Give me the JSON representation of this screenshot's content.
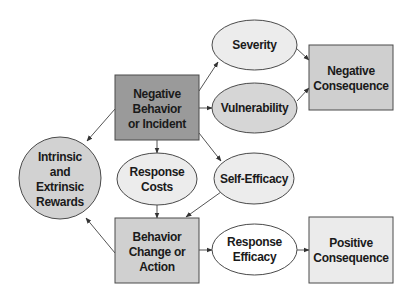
{
  "colors": {
    "dark_box": "#9a9a9a",
    "mid_box": "#cfcfcf",
    "light_box": "#ebebeb",
    "circle": "#d2d2d2",
    "ellipse_light": "#ececec",
    "ellipse_mid": "#d6d6d6",
    "ellipse_white": "#ffffff",
    "stroke": "#4a4a4a",
    "edge": "#555555"
  },
  "nodes": {
    "negative_behavior": {
      "shape": "rect",
      "lines": [
        "Negative",
        "Behavior",
        "or Incident"
      ]
    },
    "severity": {
      "shape": "ellipse",
      "lines": [
        "Severity"
      ]
    },
    "vulnerability": {
      "shape": "ellipse",
      "lines": [
        "Vulnerability"
      ]
    },
    "negative_consequence": {
      "shape": "rect",
      "lines": [
        "Negative",
        "Consequence"
      ]
    },
    "rewards": {
      "shape": "circle",
      "lines": [
        "Intrinsic",
        "and",
        "Extrinsic",
        "Rewards"
      ]
    },
    "response_costs": {
      "shape": "ellipse",
      "lines": [
        "Response",
        "Costs"
      ]
    },
    "self_efficacy": {
      "shape": "ellipse",
      "lines": [
        "Self-Efficacy"
      ]
    },
    "behavior_change": {
      "shape": "rect",
      "lines": [
        "Behavior",
        "Change or",
        "Action"
      ]
    },
    "response_efficacy": {
      "shape": "ellipse",
      "lines": [
        "Response",
        "Efficacy"
      ]
    },
    "positive_consequence": {
      "shape": "rect",
      "lines": [
        "Positive",
        "Consequence"
      ]
    }
  },
  "edges": [
    {
      "from": "negative_behavior",
      "to": "rewards"
    },
    {
      "from": "negative_behavior",
      "to": "severity"
    },
    {
      "from": "negative_behavior",
      "to": "vulnerability"
    },
    {
      "from": "negative_behavior",
      "to": "self_efficacy"
    },
    {
      "from": "negative_behavior",
      "to": "response_costs"
    },
    {
      "from": "response_costs",
      "to": "behavior_change"
    },
    {
      "from": "self_efficacy",
      "to": "behavior_change"
    },
    {
      "from": "behavior_change",
      "to": "rewards"
    },
    {
      "from": "behavior_change",
      "to": "response_efficacy"
    },
    {
      "from": "response_efficacy",
      "to": "positive_consequence"
    },
    {
      "from": "severity",
      "to": "negative_consequence"
    },
    {
      "from": "vulnerability",
      "to": "negative_consequence"
    }
  ]
}
